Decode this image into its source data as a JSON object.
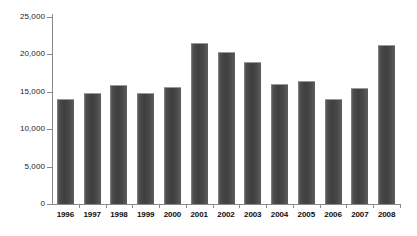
{
  "chart_data": {
    "type": "bar",
    "title": "",
    "xlabel": "",
    "ylabel": "",
    "categories": [
      "1996",
      "1997",
      "1998",
      "1999",
      "2000",
      "2001",
      "2002",
      "2003",
      "2004",
      "2005",
      "2006",
      "2007",
      "2008"
    ],
    "values": [
      14100,
      14900,
      15900,
      14900,
      15700,
      21500,
      20300,
      19000,
      16000,
      16400,
      14100,
      15500,
      21200
    ],
    "ylim": [
      0,
      25000
    ],
    "yticks": [
      0,
      5000,
      10000,
      15000,
      20000,
      25000
    ],
    "ytick_labels": [
      "0",
      "5,000",
      "10,000",
      "15,000",
      "20,000",
      "25,000"
    ],
    "grid": false,
    "legend": null,
    "bar_color": "#4a4a4a",
    "axis_color": "#8a8a8a",
    "background_color": "#ffffff"
  }
}
